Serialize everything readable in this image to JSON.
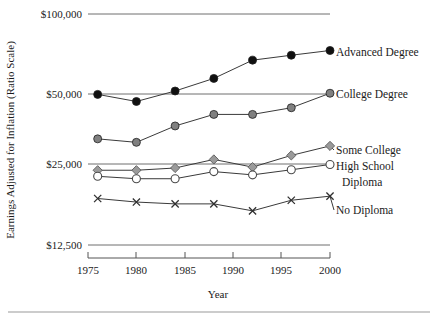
{
  "figure": {
    "yaxis_title": "Earnings Adjusted for Inflation (Ratio Scale)",
    "xaxis_title": "Year"
  },
  "chart_data": {
    "type": "line",
    "title": "",
    "xlabel": "Year",
    "ylabel": "Earnings Adjusted for Inflation (Ratio Scale)",
    "yscale": "log",
    "ylim": [
      12500,
      100000
    ],
    "xlim": [
      1975,
      2000
    ],
    "grid": true,
    "legend_position": "right-inline",
    "ytick_labels": [
      "$100,000",
      "$50,000",
      "$25,000",
      "$12,500"
    ],
    "ytick_values": [
      100000,
      50000,
      25000,
      12500
    ],
    "xtick_labels": [
      "1975",
      "1980",
      "1985",
      "1990",
      "1995",
      "2000"
    ],
    "xtick_values": [
      1975,
      1980,
      1985,
      1990,
      1995,
      2000
    ],
    "x": [
      1976,
      1980,
      1984,
      1988,
      1992,
      1996,
      2000
    ],
    "series": [
      {
        "name": "Advanced Degree",
        "marker": "filled-circle",
        "color": "#101010",
        "values": [
          48500,
          45500,
          50000,
          56000,
          66000,
          69000,
          72000
        ]
      },
      {
        "name": "College Degree",
        "marker": "filled-circle",
        "color": "#808080",
        "values": [
          32500,
          31500,
          36500,
          40500,
          40500,
          43000,
          49000
        ]
      },
      {
        "name": "Some College",
        "marker": "filled-diamond",
        "color": "#9a9a9a",
        "values": [
          24500,
          24500,
          25000,
          27000,
          25200,
          28000,
          30500
        ]
      },
      {
        "name": "High School Diploma",
        "marker": "open-circle",
        "color": "#ffffff",
        "values": [
          23200,
          22700,
          22700,
          24200,
          23500,
          24600,
          25800
        ]
      },
      {
        "name": "No Diploma",
        "marker": "cross",
        "color": "#303030",
        "values": [
          19000,
          18400,
          18100,
          18100,
          17000,
          18700,
          19400
        ]
      }
    ],
    "series_labels": [
      {
        "text": "Advanced Degree",
        "line2": ""
      },
      {
        "text": "College Degree",
        "line2": ""
      },
      {
        "text": "Some College",
        "line2": ""
      },
      {
        "text": "High School",
        "line2": "Diploma"
      },
      {
        "text": "No Diploma",
        "line2": ""
      }
    ]
  }
}
